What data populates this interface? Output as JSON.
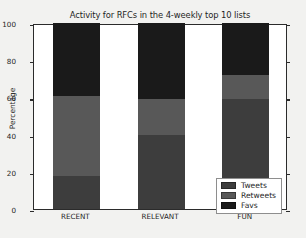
{
  "chart_data": {
    "type": "bar",
    "subtype": "stacked-bar-100",
    "title": "Activity for RFCs in the 4-weekly top 10 lists",
    "xlabel": "",
    "ylabel": "Percentage",
    "categories": [
      "RECENT",
      "RELEVANT",
      "FUN"
    ],
    "series": [
      {
        "name": "Tweets",
        "color": "#3d3d3d",
        "values": [
          18,
          40,
          59
        ]
      },
      {
        "name": "Retweets",
        "color": "#585858",
        "values": [
          42.5,
          19,
          13
        ]
      },
      {
        "name": "Favs",
        "color": "#1a1a1a",
        "values": [
          39.5,
          41,
          28
        ]
      }
    ],
    "ylim": [
      0,
      100
    ],
    "yticks": [
      0,
      20,
      40,
      60,
      80,
      100
    ],
    "ytick_labels": [
      "0",
      "20",
      "40",
      "60",
      "80",
      "100"
    ],
    "grid": false,
    "legend_position": "lower right",
    "legend_entries": [
      "Tweets",
      "Retweets",
      "Favs"
    ],
    "background_color": "#f2f2f0",
    "plot_background_color": "#ffffff",
    "axis_color": "#2b2b2b"
  }
}
